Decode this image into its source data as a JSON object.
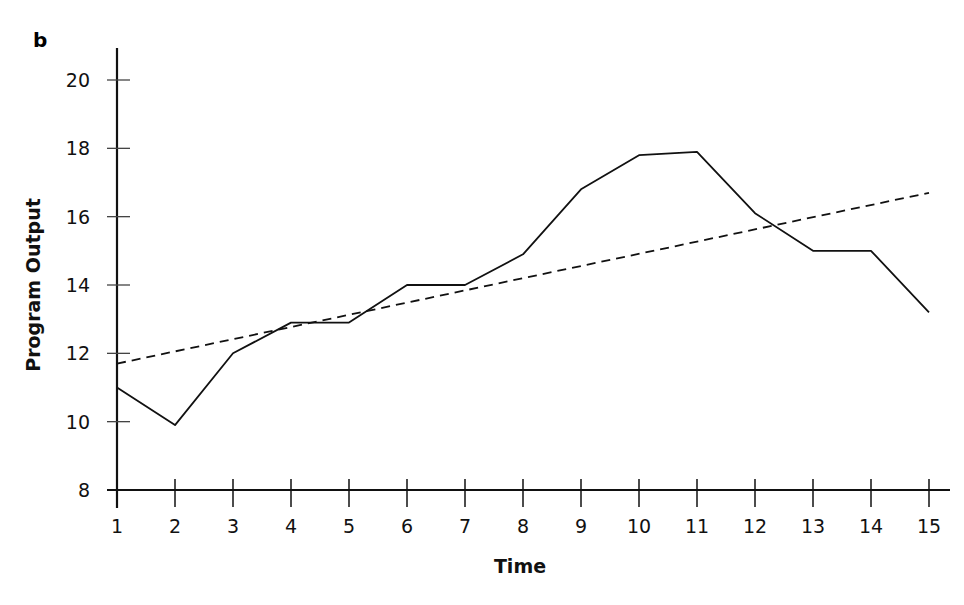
{
  "panel_label": "b",
  "chart_data": {
    "type": "line",
    "title": "",
    "xlabel": "Time",
    "ylabel": "Program Output",
    "xlim": [
      1,
      15
    ],
    "ylim": [
      8,
      20
    ],
    "x_ticks": [
      1,
      2,
      3,
      4,
      5,
      6,
      7,
      8,
      9,
      10,
      11,
      12,
      13,
      14,
      15
    ],
    "y_ticks": [
      8,
      10,
      12,
      14,
      16,
      18,
      20
    ],
    "grid": false,
    "legend": null,
    "series": [
      {
        "name": "Program Output",
        "style": "solid",
        "x": [
          1,
          2,
          3,
          4,
          5,
          6,
          7,
          8,
          9,
          10,
          11,
          12,
          13,
          14,
          15
        ],
        "values": [
          11.0,
          9.9,
          12.0,
          12.9,
          12.9,
          14.0,
          14.0,
          14.9,
          16.8,
          17.8,
          17.9,
          16.1,
          15.0,
          15.0,
          13.2
        ]
      },
      {
        "name": "Linear trend",
        "style": "dashed",
        "x": [
          1,
          15
        ],
        "values": [
          11.7,
          16.7
        ]
      }
    ]
  }
}
